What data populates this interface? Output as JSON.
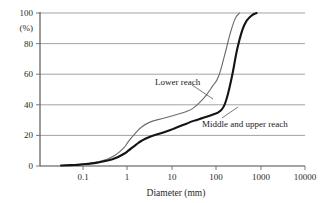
{
  "chart_data": {
    "type": "line",
    "title": "",
    "subtitle": "",
    "xlabel": "Diameter (mm)",
    "ylabel": "(%)",
    "xscale": "log",
    "yscale": "linear",
    "xlim": [
      0.01,
      10000
    ],
    "ylim": [
      0,
      100
    ],
    "xticks": [
      0.1,
      1,
      10,
      100,
      1000,
      10000
    ],
    "xtick_labels": [
      "0.1",
      "1",
      "10",
      "100",
      "1000",
      "10000"
    ],
    "yticks": [
      0,
      20,
      40,
      60,
      80,
      100
    ],
    "ytick_labels": [
      "0",
      "20",
      "40",
      "60",
      "80",
      "100"
    ],
    "grid": "horizontal",
    "legend_position": "inline-annotations",
    "series": [
      {
        "name": "Lower reach",
        "style": "thin-gray",
        "color": "#6d6d6d",
        "points": [
          [
            0.03,
            0.3
          ],
          [
            0.05,
            0.6
          ],
          [
            0.08,
            1.0
          ],
          [
            0.12,
            1.6
          ],
          [
            0.2,
            2.6
          ],
          [
            0.3,
            4.0
          ],
          [
            0.5,
            7.0
          ],
          [
            0.8,
            12.0
          ],
          [
            1.0,
            16.0
          ],
          [
            1.5,
            22.0
          ],
          [
            2.0,
            25.5
          ],
          [
            3.0,
            28.5
          ],
          [
            5.0,
            30.5
          ],
          [
            8.0,
            32.0
          ],
          [
            12.0,
            33.5
          ],
          [
            20.0,
            35.5
          ],
          [
            30.0,
            38.0
          ],
          [
            50.0,
            44.0
          ],
          [
            80.0,
            52.0
          ],
          [
            110.0,
            58.5
          ],
          [
            150.0,
            72.0
          ],
          [
            200.0,
            86.0
          ],
          [
            260.0,
            96.0
          ],
          [
            330.0,
            100.0
          ]
        ]
      },
      {
        "name": "Middle and  upper reach",
        "style": "thick-black",
        "color": "#141414",
        "points": [
          [
            0.03,
            0.3
          ],
          [
            0.05,
            0.6
          ],
          [
            0.08,
            0.9
          ],
          [
            0.12,
            1.4
          ],
          [
            0.2,
            2.2
          ],
          [
            0.3,
            3.2
          ],
          [
            0.5,
            5.0
          ],
          [
            0.8,
            8.0
          ],
          [
            1.0,
            10.0
          ],
          [
            1.5,
            14.0
          ],
          [
            2.0,
            16.5
          ],
          [
            3.0,
            19.0
          ],
          [
            5.0,
            21.0
          ],
          [
            8.0,
            23.0
          ],
          [
            12.0,
            25.0
          ],
          [
            20.0,
            27.5
          ],
          [
            30.0,
            29.5
          ],
          [
            50.0,
            31.5
          ],
          [
            80.0,
            33.5
          ],
          [
            120.0,
            36.0
          ],
          [
            160.0,
            42.0
          ],
          [
            220.0,
            58.0
          ],
          [
            300.0,
            78.0
          ],
          [
            420.0,
            92.0
          ],
          [
            600.0,
            98.0
          ],
          [
            800.0,
            100.0
          ]
        ]
      }
    ],
    "annotations": [
      {
        "text": "Lower reach",
        "target_series": "Lower reach",
        "text_x_px": 155,
        "text_y_px": 82,
        "leader_from_px": [
          192,
          85
        ],
        "leader_to_px": [
          213,
          99
        ]
      },
      {
        "text": "Middle and  upper reach",
        "target_series": "Middle and  upper reach",
        "text_x_px": 202,
        "text_y_px": 124,
        "leader_from_px": [
          222,
          118
        ],
        "leader_to_px": [
          238,
          107
        ]
      }
    ]
  },
  "axes": {
    "x_axis_title": "Diameter (mm)",
    "y_axis_unit": "(%)"
  }
}
